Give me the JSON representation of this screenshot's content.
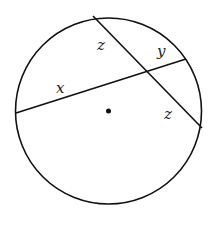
{
  "diagram": {
    "type": "circle-with-intersecting-chords",
    "circle": {
      "cx": 108.5,
      "cy": 111,
      "r": 93
    },
    "center_dot": {
      "cx": 108.5,
      "cy": 111,
      "r": 2.5
    },
    "chords": [
      {
        "name": "chord-x-y",
        "x1": 16,
        "y1": 113,
        "x2": 186,
        "y2": 59
      },
      {
        "name": "chord-z-z",
        "x1": 93,
        "y1": 16,
        "x2": 202,
        "y2": 128
      }
    ],
    "labels": [
      {
        "name": "label-z-upper",
        "text": "z",
        "x": 97,
        "y": 50
      },
      {
        "name": "label-y",
        "text": "y",
        "x": 157,
        "y": 56
      },
      {
        "name": "label-x",
        "text": "x",
        "x": 56,
        "y": 93
      },
      {
        "name": "label-z-lower",
        "text": "z",
        "x": 164,
        "y": 119
      }
    ],
    "stroke_color": "#111111"
  }
}
